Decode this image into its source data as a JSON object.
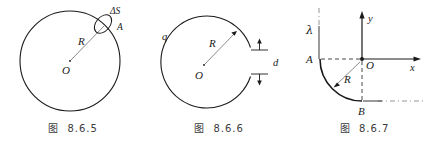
{
  "sheet": {
    "background_color": "#ffffff",
    "stroke_color": "#1a1a1a",
    "caption_color": "#3c3c3c"
  },
  "figures": [
    {
      "id": "fig-8-6-5",
      "caption_label": "图",
      "caption_number": "8.6.5",
      "description": "uniformly charged circular ring of radius R with small surface element",
      "labels": {
        "center": "O",
        "radius": "R",
        "element": "ΔS",
        "point": "A"
      }
    },
    {
      "id": "fig-8-6-6",
      "caption_label": "图",
      "caption_number": "8.6.6",
      "description": "charged ring of radius R with narrow gap of width d on the right",
      "labels": {
        "charge": "q",
        "radius": "R",
        "center": "O",
        "gap": "d"
      }
    },
    {
      "id": "fig-8-6-7",
      "caption_label": "图",
      "caption_number": "8.6.7",
      "description": "quarter circular arc of radius R with linear charge density lambda in xy coordinate system",
      "labels": {
        "linear_density": "λ",
        "point_a": "A",
        "point_b": "B",
        "origin": "O",
        "radius": "R",
        "axis_x": "x",
        "axis_y": "y"
      }
    }
  ]
}
